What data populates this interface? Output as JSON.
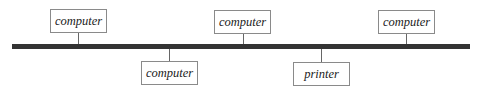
{
  "diagram": {
    "type": "bus-network-topology",
    "bus_color": "#333333",
    "nodes_top": [
      {
        "label": "computer"
      },
      {
        "label": "computer"
      },
      {
        "label": "computer"
      }
    ],
    "nodes_bottom": [
      {
        "label": "computer"
      },
      {
        "label": "printer"
      }
    ]
  }
}
